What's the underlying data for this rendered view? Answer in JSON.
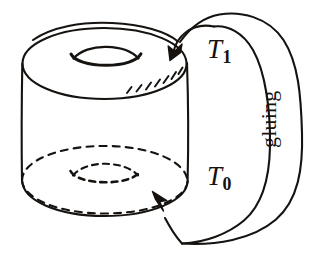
{
  "figure": {
    "kind": "hand-drawn-math-diagram",
    "background_color": "#ffffff",
    "ink_color": "#15120f",
    "stroke_width_px": 2.1
  },
  "labels": {
    "top_boundary": {
      "base": "T",
      "subscript": "1",
      "full": "T1",
      "name": "T-one-label"
    },
    "bottom_boundary": {
      "base": "T",
      "subscript": "0",
      "full": "T0",
      "name": "T-zero-label"
    },
    "gluing": {
      "text": "gluing",
      "rotation_degrees": -90
    }
  },
  "shapes": {
    "cylinder": {
      "top_face": "ellipse",
      "bottom_face": "ellipse-dashed",
      "top_hole": "lens",
      "bottom_hole": "lens-dashed",
      "hatching_strokes": 7
    },
    "gluing_band": {
      "arrowheads": 2,
      "arrow_into_top": "down-left",
      "arrow_into_bottom": "up-left"
    }
  },
  "icons": {
    "arrowhead_top": "arrow-down-left-icon",
    "arrowhead_bottom": "arrow-up-left-icon"
  }
}
